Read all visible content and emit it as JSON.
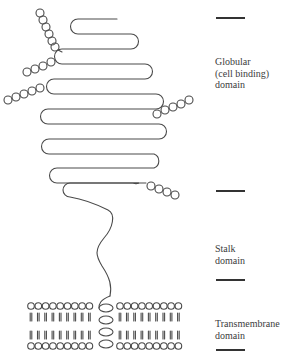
{
  "diagram": {
    "colors": {
      "stroke": "#4a4a4a",
      "bar": "#333333",
      "text": "#3c3c3c",
      "background": "#ffffff"
    },
    "domains": [
      {
        "id": "globular",
        "label": "Globular\n(cell binding)\ndomain",
        "top_bar_y": 17,
        "label_y": 56
      },
      {
        "id": "stalk",
        "label": "Stalk\ndomain",
        "top_bar_y": 190,
        "label_y": 243
      },
      {
        "id": "transmembrane",
        "label": "Transmembrane\ndomain",
        "top_bar_y": 279,
        "label_y": 318
      }
    ],
    "bottom_bar_y": 349,
    "polypeptide": {
      "strands": [
        {
          "y": 19,
          "x1": 72,
          "x2": 117
        },
        {
          "y": 34,
          "x1": 72,
          "x2": 138
        },
        {
          "y": 49,
          "x1": 55,
          "x2": 138
        },
        {
          "y": 64,
          "x1": 55,
          "x2": 152
        },
        {
          "y": 79,
          "x1": 47,
          "x2": 152
        },
        {
          "y": 94,
          "x1": 47,
          "x2": 163
        },
        {
          "y": 109,
          "x1": 41,
          "x2": 163
        },
        {
          "y": 124,
          "x1": 41,
          "x2": 166
        },
        {
          "y": 139,
          "x1": 42,
          "x2": 166
        },
        {
          "y": 154,
          "x1": 42,
          "x2": 161
        },
        {
          "y": 168,
          "x1": 50,
          "x2": 161
        },
        {
          "y": 183,
          "x1": 50,
          "x2": 146
        },
        {
          "y": 196,
          "x1": 62,
          "x2": 146
        }
      ]
    },
    "sugar_chains": [
      {
        "name": "top-chain",
        "count": 6
      },
      {
        "name": "upper-left-chain",
        "count": 4
      },
      {
        "name": "lower-left-chain",
        "count": 5
      },
      {
        "name": "upper-right-chain",
        "count": 5
      },
      {
        "name": "lower-right-chain",
        "count": 4
      }
    ],
    "membrane": {
      "lipids_left": 9,
      "lipids_right": 9,
      "helix_turns": 4
    }
  }
}
